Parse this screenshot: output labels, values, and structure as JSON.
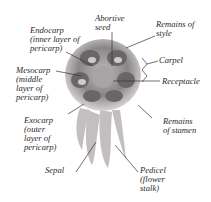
{
  "diagram": {
    "labels": {
      "endocarp": "Endocarp\n(inner layer of\npericarp)",
      "abortive_seed": "Abortive\nseed",
      "remains_of_style": "Remains of\nstyle",
      "mesocarp": "Mesocarp\n(middle\nlayer of\npericarp)",
      "carpel": "Carpel",
      "receptacle": "Receptacle",
      "exocarp": "Exocarp\n(outer\nlayer of\npericarp)",
      "remains_of_stamen": "Remains\nof stamen",
      "sepal": "Sepal",
      "pedicel": "Pedicel\n(flower\nstalk)"
    },
    "colors": {
      "specimen_dark": "#5a5558",
      "specimen_mid": "#8a8688",
      "specimen_light": "#c9c6c6",
      "leader_line": "#333333",
      "text": "#2a2a2a"
    }
  }
}
